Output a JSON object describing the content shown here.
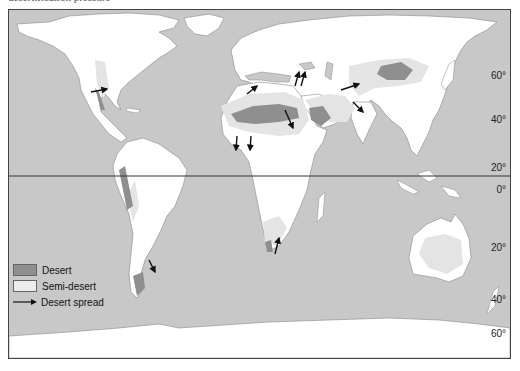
{
  "caption": {
    "text": "desertification pressure"
  },
  "map": {
    "title": "World desert and semi-desert regions with desert spread",
    "colors": {
      "ocean": "#c8c8c8",
      "land": "#ffffff",
      "desert": "#8f8f8f",
      "semi_desert": "#e4e4e4",
      "arrow": "#111111",
      "equator": "#333333"
    },
    "latitude_labels": [
      {
        "label": "60°",
        "lat": 60
      },
      {
        "label": "40°",
        "lat": 40
      },
      {
        "label": "20°",
        "lat": 20
      },
      {
        "label": "0°",
        "lat": 0
      },
      {
        "label": "20°",
        "lat": -20
      },
      {
        "label": "40°",
        "lat": -40
      },
      {
        "label": "60°",
        "lat": -60
      }
    ],
    "equator": "0°"
  },
  "legend": {
    "items": [
      {
        "label": "Desert",
        "type": "desert"
      },
      {
        "label": "Semi-desert",
        "type": "semi_desert"
      },
      {
        "label": "Desert spread",
        "type": "arrow"
      }
    ]
  }
}
